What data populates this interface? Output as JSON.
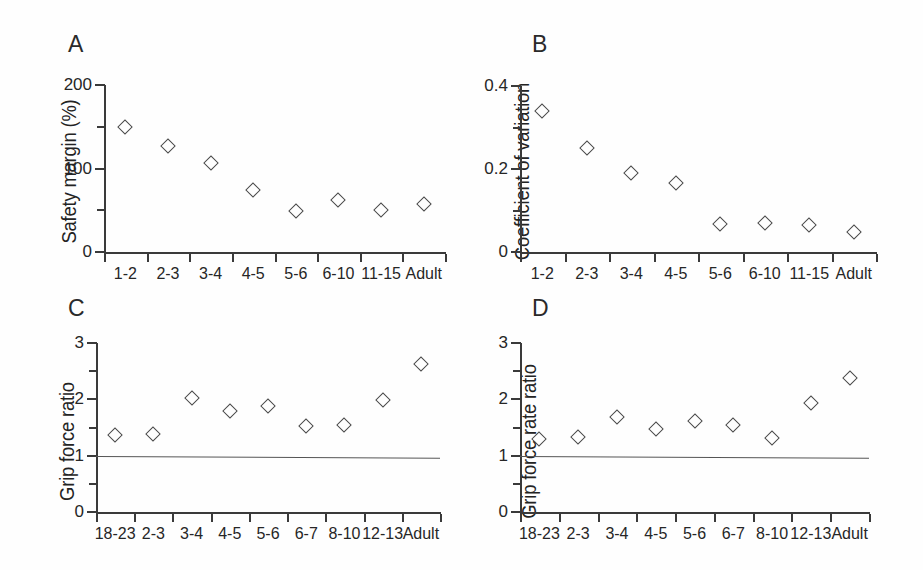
{
  "figure": {
    "background": "#ffffff",
    "marker_color": "#4a4a4a",
    "axis_color": "#3a3a3a",
    "marker_shape": "open-diamond"
  },
  "panels": [
    {
      "letter": "A",
      "ylabel": "Safety margin (%)",
      "yticklabels": [
        "0",
        "100",
        "200"
      ],
      "xticklabels": [
        "1-2",
        "2-3",
        "3-4",
        "4-5",
        "5-6",
        "6-10",
        "11-15",
        "Adult"
      ]
    },
    {
      "letter": "B",
      "ylabel": "Coefficient of variation",
      "yticklabels": [
        "0",
        "0.2",
        "0.4"
      ],
      "xticklabels": [
        "1-2",
        "2-3",
        "3-4",
        "4-5",
        "5-6",
        "6-10",
        "11-15",
        "Adult"
      ]
    },
    {
      "letter": "C",
      "ylabel": "Grip force ratio",
      "yticklabels": [
        "0",
        "1",
        "2",
        "3"
      ],
      "xticklabels": [
        "18-23",
        "2-3",
        "3-4",
        "4-5",
        "5-6",
        "6-7",
        "8-10",
        "12-13",
        "Adult"
      ]
    },
    {
      "letter": "D",
      "ylabel": "Grip force rate ratio",
      "yticklabels": [
        "0",
        "1",
        "2",
        "3"
      ],
      "xticklabels": [
        "18-23",
        "2-3",
        "3-4",
        "4-5",
        "5-6",
        "6-7",
        "8-10",
        "12-13",
        "Adult"
      ]
    }
  ],
  "chart_data": [
    {
      "panel": "A",
      "type": "scatter",
      "title": "A",
      "xlabel": "",
      "ylabel": "Safety margin (%)",
      "categories": [
        "1-2",
        "2-3",
        "3-4",
        "4-5",
        "5-6",
        "6-10",
        "11-15",
        "Adult"
      ],
      "values": [
        150,
        127,
        106,
        74,
        49,
        62,
        50,
        57
      ],
      "ylim": [
        0,
        200
      ],
      "yticks": [
        0,
        50,
        100,
        150,
        200
      ],
      "ytick_labels_shown": [
        0,
        100,
        200
      ],
      "grid": false,
      "legend": "none",
      "marker": "open-diamond"
    },
    {
      "panel": "B",
      "type": "scatter",
      "title": "B",
      "xlabel": "",
      "ylabel": "Coefficient of variation",
      "categories": [
        "1-2",
        "2-3",
        "3-4",
        "4-5",
        "5-6",
        "6-10",
        "11-15",
        "Adult"
      ],
      "values": [
        0.34,
        0.25,
        0.19,
        0.167,
        0.068,
        0.07,
        0.065,
        0.048
      ],
      "ylim": [
        0,
        0.4
      ],
      "yticks": [
        0,
        0.1,
        0.2,
        0.3,
        0.4
      ],
      "ytick_labels_shown": [
        0,
        0.2,
        0.4
      ],
      "grid": false,
      "legend": "none",
      "marker": "open-diamond"
    },
    {
      "panel": "C",
      "type": "scatter",
      "title": "C",
      "xlabel": "",
      "ylabel": "Grip force ratio",
      "categories": [
        "18-23",
        "2-3",
        "3-4",
        "4-5",
        "5-6",
        "6-7",
        "8-10",
        "12-13",
        "Adult"
      ],
      "values": [
        1.36,
        1.38,
        2.03,
        1.79,
        1.88,
        1.53,
        1.55,
        1.99,
        2.63
      ],
      "ylim": [
        0,
        3
      ],
      "yticks": [
        0,
        0.5,
        1,
        1.5,
        2,
        2.5,
        3
      ],
      "ytick_labels_shown": [
        0,
        1,
        2,
        3
      ],
      "reference_line": 1,
      "grid": false,
      "legend": "none",
      "marker": "open-diamond"
    },
    {
      "panel": "D",
      "type": "scatter",
      "title": "D",
      "xlabel": "",
      "ylabel": "Grip force rate ratio",
      "categories": [
        "18-23",
        "2-3",
        "3-4",
        "4-5",
        "5-6",
        "6-7",
        "8-10",
        "12-13",
        "Adult"
      ],
      "values": [
        1.29,
        1.33,
        1.69,
        1.48,
        1.61,
        1.55,
        1.31,
        1.94,
        2.38
      ],
      "ylim": [
        0,
        3
      ],
      "yticks": [
        0,
        0.5,
        1,
        1.5,
        2,
        2.5,
        3
      ],
      "ytick_labels_shown": [
        0,
        1,
        2,
        3
      ],
      "reference_line": 1,
      "grid": false,
      "legend": "none",
      "marker": "open-diamond"
    }
  ]
}
